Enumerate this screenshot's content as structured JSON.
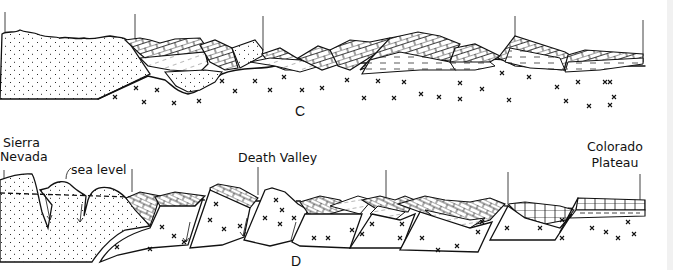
{
  "figure": {
    "panels": [
      {
        "id": "C",
        "label": "C",
        "description": "Cross-section with thrust-faulted layered sedimentary sequence over crystalline basement"
      },
      {
        "id": "D",
        "label": "D",
        "description": "Cross-section with tilted fault blocks (Basin and Range) between Sierra Nevada and Colorado Plateau",
        "annotations": {
          "sierra_nevada": "Sierra\nNevada",
          "sierra_line1": "Sierra",
          "sierra_line2": "Nevada",
          "sea_level": "sea level",
          "death_valley": "Death Valley",
          "colorado_line1": "Colorado",
          "colorado_line2": "Plateau"
        }
      }
    ],
    "patterns": {
      "stipple": "granitic / volcanic dotted fill",
      "crosses": "crystalline basement (x marks)",
      "brick": "layered carbonate blocks",
      "dashed": "shale / sandstone layers"
    },
    "colors": {
      "ink": "#111111",
      "paper": "#ffffff",
      "edge": "#f1f1f1"
    }
  }
}
